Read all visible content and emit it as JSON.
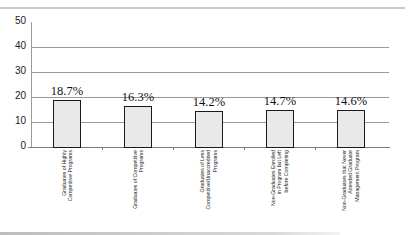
{
  "chart_data": {
    "type": "bar",
    "title": "",
    "xlabel": "",
    "ylabel": "",
    "ylim": [
      0,
      50
    ],
    "yticks": [
      0,
      10,
      20,
      30,
      40,
      50
    ],
    "grid": true,
    "legend": null,
    "categories": [
      "Graduates of Highly Competitive Programs",
      "Graduates of Competitive Programs",
      "Graduates of Less Competitive/Unaccredited Programs",
      "Non-Graduates Enrolled in Program but Left before Completing",
      "Non-Graduates that Never Attended Graduate Management Program"
    ],
    "values": [
      18.7,
      16.3,
      14.2,
      14.7,
      14.6
    ],
    "data_labels": [
      "18.7%",
      "16.3%",
      "14.2%",
      "14.7%",
      "14.6%"
    ],
    "bar_fill": "#e9e9e9",
    "bar_border": "#1a1a1a"
  },
  "ytick_labels": [
    "50",
    "40",
    "30",
    "20",
    "10",
    "0"
  ],
  "category_label_lines": [
    "Graduates of Highly\nCompetitive Programs",
    "Graduates of Competitive\nPrograms",
    "Graduates of Less\nCompetitive/Unaccredited\nPrograms",
    "Non-Graduates Enrolled\nin Program but Left\nbefore Completing",
    "Non-Graduates that Never\nAttended Graduate\nManagement Program"
  ]
}
